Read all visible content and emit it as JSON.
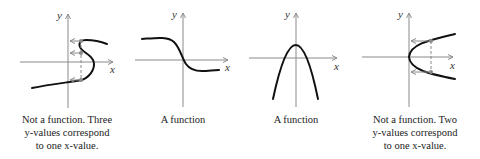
{
  "graphs": [
    {
      "name": "s-curve",
      "axis_labels": {
        "x": "x",
        "y": "y"
      },
      "caption_lines": [
        "Not a function. Three",
        "y-values correspond",
        "to one x-value."
      ],
      "verdict": "Not a function"
    },
    {
      "name": "decreasing-curve",
      "axis_labels": {
        "x": "x",
        "y": "y"
      },
      "caption_lines": [
        "A function"
      ],
      "verdict": "A function"
    },
    {
      "name": "downward-parabola",
      "axis_labels": {
        "x": "x",
        "y": "y"
      },
      "caption_lines": [
        "A function"
      ],
      "verdict": "A function"
    },
    {
      "name": "sideways-parabola",
      "axis_labels": {
        "x": "x",
        "y": "y"
      },
      "caption_lines": [
        "Not a function. Two",
        "y-values correspond",
        "to one x-value."
      ],
      "verdict": "Not a function"
    }
  ],
  "colors": {
    "curve": "#111111",
    "axis": "#8a8a8a",
    "guide": "#8a8a8a"
  }
}
